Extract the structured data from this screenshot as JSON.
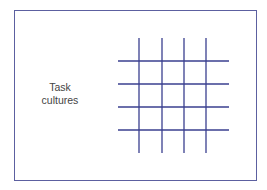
{
  "diagram": {
    "label_line1": "Task",
    "label_line2": "cultures",
    "grid": {
      "color": "#3a3f8f",
      "vertical_x": [
        139,
        162,
        184,
        206
      ],
      "vertical_y_range": [
        38,
        153
      ],
      "horizontal_y": [
        61,
        84,
        107,
        130
      ],
      "horizontal_x_range": [
        118,
        229
      ]
    },
    "frame_color": "#5c60a0"
  }
}
